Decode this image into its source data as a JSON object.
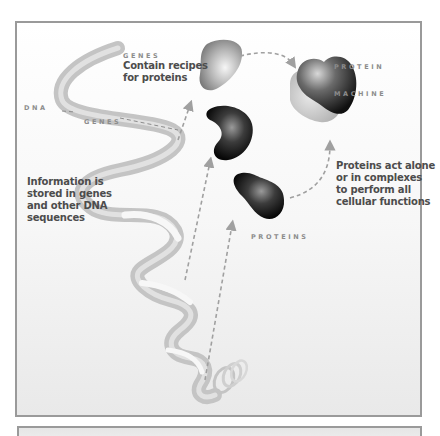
{
  "diagram": {
    "labels": {
      "dna": "DNA",
      "genes_on_helix": "GENES",
      "genes_heading": "GENES",
      "genes_caption": [
        "Contain recipes",
        "for proteins"
      ],
      "dna_caption": [
        "Information is",
        "stored in genes",
        "and other DNA",
        "sequences"
      ],
      "protein_machine": [
        "PROTEIN",
        "MACHINE"
      ],
      "proteins": "PROTEINS",
      "proteins_caption": [
        "Proteins act alone",
        "or in complexes",
        "to perform all",
        "cellular functions"
      ]
    },
    "colors": {
      "frame_border": "#9a9a9a",
      "ribbon": "#c8c8c8",
      "ribbon_highlight": "#f4f4f4",
      "arrow": "#a0a0a0",
      "caption_text": "#4c4c4c",
      "caps_text": "#8c8c8c",
      "protein_dark": "#141414",
      "protein_light": "#c9c9c9"
    }
  }
}
